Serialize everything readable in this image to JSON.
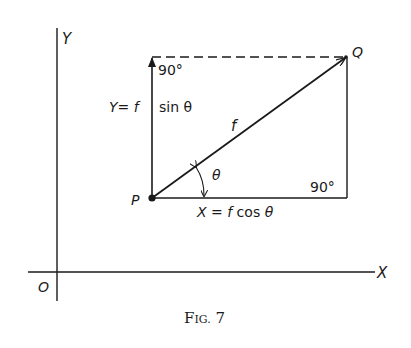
{
  "figure": {
    "caption": "Fig. 7",
    "caption_main": "F",
    "caption_small": "IG.",
    "caption_num": "7"
  },
  "axes": {
    "y_label": "Y",
    "x_label": "X",
    "origin_label": "O"
  },
  "points": {
    "p_label": "P",
    "q_label": "Q"
  },
  "vectors": {
    "resultant_label": "f",
    "y_component_label": "Y = f  sin θ",
    "y_component_left": "Y= f",
    "y_component_right": "sin θ",
    "x_component_label": "X = f  cos θ",
    "angle_label": "θ"
  },
  "angles": {
    "top_left": "90°",
    "bottom_right": "90°"
  },
  "colors": {
    "ink": "#1a1a1a",
    "background": "#ffffff"
  }
}
